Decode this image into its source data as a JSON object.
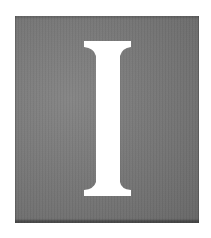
{
  "drop_cap": {
    "letter": "I",
    "plate_color": "#7a7a7a",
    "letter_color": "#ffffff"
  }
}
